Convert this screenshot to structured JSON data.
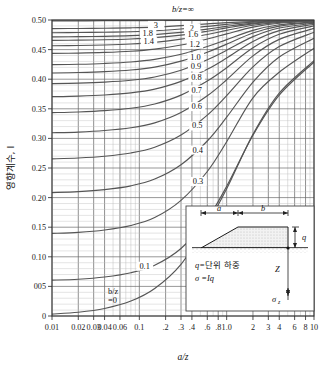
{
  "chart_data": {
    "type": "line",
    "title": "",
    "xlabel": "a/z",
    "ylabel": "영향계수, I",
    "xscale": "log",
    "xlim": [
      0.01,
      10
    ],
    "ylim": [
      0,
      0.5
    ],
    "grid": true,
    "top_annotation": "b/z=∞",
    "bottom_annotation_1": "b/z",
    "bottom_annotation_2": "=0",
    "legend_position": "inline-right",
    "x_ticks": [
      {
        "v": 0.01,
        "label": "0.01"
      },
      {
        "v": 0.02,
        "label": "0.02"
      },
      {
        "v": 0.03,
        "label": "0.03"
      },
      {
        "v": 0.04,
        "label": "0.04"
      },
      {
        "v": 0.06,
        "label": "0.06"
      },
      {
        "v": 0.1,
        "label": "0.1"
      },
      {
        "v": 0.2,
        "label": ".2"
      },
      {
        "v": 0.3,
        "label": ".3"
      },
      {
        "v": 0.4,
        "label": ".4"
      },
      {
        "v": 0.6,
        "label": ".6"
      },
      {
        "v": 0.8,
        "label": ".8"
      },
      {
        "v": 1.0,
        "label": "1.0"
      },
      {
        "v": 2,
        "label": "2"
      },
      {
        "v": 3,
        "label": "3"
      },
      {
        "v": 4,
        "label": "4"
      },
      {
        "v": 6,
        "label": "6"
      },
      {
        "v": 8,
        "label": "8"
      },
      {
        "v": 10,
        "label": "10"
      }
    ],
    "y_ticks": [
      {
        "v": 0.0,
        "label": "0"
      },
      {
        "v": 0.05,
        "label": "005"
      },
      {
        "v": 0.1,
        "label": "0.10"
      },
      {
        "v": 0.15,
        "label": "0.15"
      },
      {
        "v": 0.2,
        "label": "0.20"
      },
      {
        "v": 0.25,
        "label": "0.25"
      },
      {
        "v": 0.3,
        "label": "0.30"
      },
      {
        "v": 0.35,
        "label": "0.35"
      },
      {
        "v": 0.4,
        "label": "0.40"
      },
      {
        "v": 0.45,
        "label": "0.45"
      },
      {
        "v": 0.5,
        "label": "0.50"
      }
    ],
    "series": [
      {
        "name": "∞",
        "label": "",
        "label_x": 2.55,
        "label_y": 0.497,
        "points": [
          [
            0.01,
            0.4985
          ],
          [
            0.02,
            0.4985
          ],
          [
            0.04,
            0.499
          ],
          [
            0.1,
            0.499
          ],
          [
            0.3,
            0.4993
          ],
          [
            1.0,
            0.4995
          ],
          [
            3.0,
            0.4997
          ],
          [
            10,
            0.4998
          ]
        ]
      },
      {
        "name": "3",
        "label": "3",
        "label_x": 0.155,
        "label_y": 0.4885,
        "points": [
          [
            0.01,
            0.4855
          ],
          [
            0.02,
            0.4857
          ],
          [
            0.04,
            0.486
          ],
          [
            0.08,
            0.4868
          ],
          [
            0.15,
            0.488
          ],
          [
            0.3,
            0.4905
          ],
          [
            0.6,
            0.4935
          ],
          [
            1.0,
            0.4955
          ],
          [
            2.0,
            0.4975
          ],
          [
            4.0,
            0.4988
          ],
          [
            10,
            0.4995
          ]
        ]
      },
      {
        "name": "2",
        "label": "2",
        "label_x": 0.4,
        "label_y": 0.4835,
        "points": [
          [
            0.01,
            0.4785
          ],
          [
            0.02,
            0.4788
          ],
          [
            0.04,
            0.4793
          ],
          [
            0.08,
            0.4802
          ],
          [
            0.15,
            0.4818
          ],
          [
            0.3,
            0.4848
          ],
          [
            0.6,
            0.4892
          ],
          [
            1.0,
            0.4925
          ],
          [
            2.0,
            0.4963
          ],
          [
            4.0,
            0.4983
          ],
          [
            10,
            0.4994
          ]
        ]
      },
      {
        "name": "1.8",
        "label": "1.8",
        "label_x": 0.125,
        "label_y": 0.4745,
        "points": [
          [
            0.01,
            0.4715
          ],
          [
            0.02,
            0.4718
          ],
          [
            0.04,
            0.4724
          ],
          [
            0.08,
            0.4735
          ],
          [
            0.15,
            0.4754
          ],
          [
            0.3,
            0.479
          ],
          [
            0.6,
            0.4845
          ],
          [
            1.0,
            0.4893
          ],
          [
            2.0,
            0.4948
          ],
          [
            4.0,
            0.4977
          ],
          [
            10,
            0.4992
          ]
        ]
      },
      {
        "name": "1.6",
        "label": "1.6",
        "label_x": 0.41,
        "label_y": 0.4722,
        "points": [
          [
            0.01,
            0.4655
          ],
          [
            0.02,
            0.4659
          ],
          [
            0.04,
            0.4666
          ],
          [
            0.08,
            0.4679
          ],
          [
            0.15,
            0.4702
          ],
          [
            0.3,
            0.4745
          ],
          [
            0.6,
            0.481
          ],
          [
            1.0,
            0.4866
          ],
          [
            2.0,
            0.4934
          ],
          [
            4.0,
            0.4971
          ],
          [
            10,
            0.499
          ]
        ]
      },
      {
        "name": "1.4",
        "label": "1.4",
        "label_x": 0.128,
        "label_y": 0.4608,
        "points": [
          [
            0.01,
            0.4565
          ],
          [
            0.02,
            0.457
          ],
          [
            0.04,
            0.4578
          ],
          [
            0.08,
            0.4594
          ],
          [
            0.15,
            0.4622
          ],
          [
            0.3,
            0.4676
          ],
          [
            0.6,
            0.4756
          ],
          [
            1.0,
            0.4824
          ],
          [
            2.0,
            0.4911
          ],
          [
            4.0,
            0.4961
          ],
          [
            10,
            0.4986
          ]
        ]
      },
      {
        "name": "1.2",
        "label": "1.2",
        "label_x": 0.43,
        "label_y": 0.4565,
        "points": [
          [
            0.01,
            0.4435
          ],
          [
            0.02,
            0.4441
          ],
          [
            0.04,
            0.4452
          ],
          [
            0.08,
            0.4472
          ],
          [
            0.15,
            0.4508
          ],
          [
            0.3,
            0.4577
          ],
          [
            0.6,
            0.4679
          ],
          [
            1.0,
            0.4766
          ],
          [
            2.0,
            0.4879
          ],
          [
            4.0,
            0.4946
          ],
          [
            10,
            0.498
          ]
        ]
      },
      {
        "name": "1.0",
        "label": "1.0",
        "label_x": 0.44,
        "label_y": 0.4345,
        "points": [
          [
            0.01,
            0.4245
          ],
          [
            0.02,
            0.4252
          ],
          [
            0.04,
            0.4266
          ],
          [
            0.08,
            0.429
          ],
          [
            0.15,
            0.4334
          ],
          [
            0.3,
            0.4421
          ],
          [
            0.6,
            0.4552
          ],
          [
            1.0,
            0.4668
          ],
          [
            2.0,
            0.4824
          ],
          [
            4.0,
            0.4919
          ],
          [
            10,
            0.4969
          ]
        ]
      },
      {
        "name": "0.9",
        "label": "0.9",
        "label_x": 0.445,
        "label_y": 0.4185,
        "points": [
          [
            0.01,
            0.4105
          ],
          [
            0.02,
            0.4113
          ],
          [
            0.04,
            0.4128
          ],
          [
            0.08,
            0.4156
          ],
          [
            0.15,
            0.4205
          ],
          [
            0.3,
            0.4305
          ],
          [
            0.6,
            0.4456
          ],
          [
            1.0,
            0.4592
          ],
          [
            2.0,
            0.478
          ],
          [
            4.0,
            0.4897
          ],
          [
            10,
            0.496
          ]
        ]
      },
      {
        "name": "0.8",
        "label": "0.8",
        "label_x": 0.45,
        "label_y": 0.4005,
        "points": [
          [
            0.01,
            0.3925
          ],
          [
            0.02,
            0.3934
          ],
          [
            0.04,
            0.3951
          ],
          [
            0.08,
            0.3982
          ],
          [
            0.15,
            0.4038
          ],
          [
            0.3,
            0.4152
          ],
          [
            0.6,
            0.4328
          ],
          [
            1.0,
            0.4489
          ],
          [
            2.0,
            0.4719
          ],
          [
            4.0,
            0.4865
          ],
          [
            10,
            0.4947
          ]
        ]
      },
      {
        "name": "0.7",
        "label": "0.7",
        "label_x": 0.455,
        "label_y": 0.3792,
        "points": [
          [
            0.01,
            0.3705
          ],
          [
            0.02,
            0.3715
          ],
          [
            0.04,
            0.3734
          ],
          [
            0.08,
            0.377
          ],
          [
            0.15,
            0.3833
          ],
          [
            0.3,
            0.3963
          ],
          [
            0.6,
            0.4167
          ],
          [
            1.0,
            0.4357
          ],
          [
            2.0,
            0.4637
          ],
          [
            4.0,
            0.482
          ],
          [
            10,
            0.4928
          ]
        ]
      },
      {
        "name": "0.6",
        "label": "0.6",
        "label_x": 0.455,
        "label_y": 0.3512,
        "points": [
          [
            0.01,
            0.3435
          ],
          [
            0.02,
            0.3446
          ],
          [
            0.04,
            0.3468
          ],
          [
            0.08,
            0.3509
          ],
          [
            0.15,
            0.3581
          ],
          [
            0.3,
            0.3731
          ],
          [
            0.6,
            0.3969
          ],
          [
            1.0,
            0.4194
          ],
          [
            2.0,
            0.4531
          ],
          [
            4.0,
            0.4758
          ],
          [
            10,
            0.49
          ]
        ]
      },
      {
        "name": "0.5",
        "label": "0.5",
        "label_x": 0.46,
        "label_y": 0.3185,
        "points": [
          [
            0.01,
            0.3095
          ],
          [
            0.02,
            0.3107
          ],
          [
            0.04,
            0.3133
          ],
          [
            0.08,
            0.318
          ],
          [
            0.15,
            0.3263
          ],
          [
            0.3,
            0.3438
          ],
          [
            0.6,
            0.372
          ],
          [
            1.0,
            0.3991
          ],
          [
            2.0,
            0.4394
          ],
          [
            4.0,
            0.4673
          ],
          [
            10,
            0.4858
          ]
        ]
      },
      {
        "name": "0.4",
        "label": "0.4",
        "label_x": 0.465,
        "label_y": 0.2778,
        "points": [
          [
            0.01,
            0.2655
          ],
          [
            0.02,
            0.2669
          ],
          [
            0.04,
            0.2699
          ],
          [
            0.08,
            0.2754
          ],
          [
            0.15,
            0.2851
          ],
          [
            0.3,
            0.3056
          ],
          [
            0.6,
            0.3392
          ],
          [
            1.0,
            0.3723
          ],
          [
            2.0,
            0.4209
          ],
          [
            4.0,
            0.4551
          ],
          [
            10,
            0.4793
          ]
        ]
      },
      {
        "name": "0.3",
        "label": "0.3",
        "label_x": 0.47,
        "label_y": 0.2248,
        "points": [
          [
            0.01,
            0.2085
          ],
          [
            0.02,
            0.2101
          ],
          [
            0.04,
            0.2135
          ],
          [
            0.08,
            0.2199
          ],
          [
            0.15,
            0.2313
          ],
          [
            0.3,
            0.2555
          ],
          [
            0.6,
            0.2956
          ],
          [
            1.0,
            0.3358
          ],
          [
            2.0,
            0.3951
          ],
          [
            4.0,
            0.4376
          ],
          [
            10,
            0.4692
          ]
        ]
      },
      {
        "name": "0.2",
        "label": "0.2",
        "label_x": 0.475,
        "label_y": 0.1615,
        "points": [
          [
            0.01,
            0.1395
          ],
          [
            0.02,
            0.1413
          ],
          [
            0.04,
            0.1453
          ],
          [
            0.08,
            0.1529
          ],
          [
            0.15,
            0.1663
          ],
          [
            0.3,
            0.1953
          ],
          [
            0.6,
            0.2441
          ],
          [
            1.0,
            0.2944
          ],
          [
            2.0,
            0.3686
          ],
          [
            4.0,
            0.4117
          ],
          [
            10,
            0.4522
          ]
        ]
      },
      {
        "name": "0.1",
        "label": "0.1",
        "label_x": 0.115,
        "label_y": 0.0815,
        "points": [
          [
            0.01,
            0.0605
          ],
          [
            0.02,
            0.0621
          ],
          [
            0.04,
            0.0659
          ],
          [
            0.08,
            0.0731
          ],
          [
            0.15,
            0.0859
          ],
          [
            0.3,
            0.1141
          ],
          [
            0.6,
            0.1641
          ],
          [
            1.0,
            0.2191
          ],
          [
            2.0,
            0.3053
          ],
          [
            4.0,
            0.3731
          ],
          [
            10,
            0.4289
          ]
        ]
      },
      {
        "name": "0",
        "label": "",
        "label_x": 0.135,
        "label_y": 0.021,
        "points": [
          [
            0.01,
            0.0032
          ],
          [
            0.02,
            0.0063
          ],
          [
            0.04,
            0.0127
          ],
          [
            0.08,
            0.0252
          ],
          [
            0.15,
            0.0464
          ],
          [
            0.3,
            0.0872
          ],
          [
            0.6,
            0.1551
          ],
          [
            1.0,
            0.2148
          ],
          [
            2.0,
            0.3068
          ],
          [
            4.0,
            0.3765
          ],
          [
            10,
            0.4313
          ]
        ]
      }
    ],
    "inset": {
      "dim_a": "a",
      "dim_b": "b",
      "height_q": "q",
      "depth_z": "Z",
      "stress": "σ",
      "stress_sub": "z",
      "note_1_lead": "q=",
      "note_1_text": "단위 하중",
      "note_2": "σ  =Iq",
      "note_2_sub": "z"
    }
  }
}
